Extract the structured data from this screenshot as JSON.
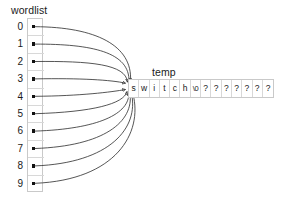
{
  "diagram": {
    "type": "pointer-array-diagram",
    "wordlist": {
      "label": "wordlist",
      "indices": [
        "0",
        "1",
        "2",
        "3",
        "4",
        "5",
        "6",
        "7",
        "8",
        "9"
      ],
      "count": 10,
      "cell_value": ""
    },
    "temp": {
      "label": "temp",
      "cells": [
        "s",
        "w",
        "i",
        "t",
        "c",
        "h",
        "\\0",
        "?",
        "?",
        "?",
        "?",
        "?",
        "?",
        "?"
      ],
      "string_value": "switch",
      "terminator": "\\0",
      "uninitialized_char": "?",
      "cell_count": 14
    },
    "arrows": {
      "description": "every wordlist entry points at the start of temp",
      "count": 10,
      "target": "temp-cell-0"
    },
    "colors": {
      "background": "#ffffff",
      "stroke": "#2b2b2b",
      "cell_border": "#c9c9c9",
      "text": "#1a1a1a",
      "pointer_dot": "#111111"
    }
  }
}
